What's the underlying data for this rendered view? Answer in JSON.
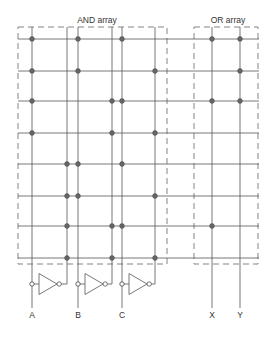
{
  "diagram": {
    "title_and": "AND array",
    "title_or": "OR array",
    "colors": {
      "line": "#555555",
      "dash": "#777777",
      "dot": "#666666",
      "text": "#333333",
      "background": "#ffffff"
    },
    "inputs": [
      {
        "label": "A",
        "x": 32,
        "inv_x": 67
      },
      {
        "label": "B",
        "x": 78,
        "inv_x": 112
      },
      {
        "label": "C",
        "x": 122,
        "inv_x": 155
      }
    ],
    "outputs": [
      {
        "label": "X",
        "x": 212
      },
      {
        "label": "Y",
        "x": 240
      }
    ],
    "rows_y": [
      39,
      71,
      101,
      133,
      164,
      196,
      226,
      258
    ],
    "and_connections": [
      [
        "A",
        "B",
        "C"
      ],
      [
        "A",
        "B",
        "C'"
      ],
      [
        "A",
        "B'",
        "C"
      ],
      [
        "A",
        "B'",
        "C'"
      ],
      [
        "A'",
        "B",
        "C"
      ],
      [
        "A'",
        "B",
        "C'"
      ],
      [
        "A'",
        "B'",
        "C"
      ],
      [
        "A'",
        "B'",
        "C'"
      ]
    ],
    "or_connections": {
      "X": [
        0,
        2,
        6
      ],
      "Y": [
        0,
        1,
        2
      ]
    },
    "and_box": {
      "x1": 18,
      "y1": 27,
      "x2": 167,
      "y2": 264
    },
    "or_box": {
      "x1": 194,
      "y1": 27,
      "x2": 258,
      "y2": 264
    },
    "inverter_y": 284,
    "line_bottom_y": 308,
    "label_y": 318
  }
}
